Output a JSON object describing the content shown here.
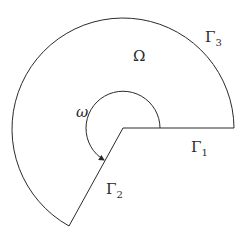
{
  "diagram": {
    "labels": {
      "domain": "Ω",
      "boundary_1": "Γ",
      "boundary_1_sub": "1",
      "boundary_2": "Γ",
      "boundary_2_sub": "2",
      "boundary_3": "Γ",
      "boundary_3_sub": "3",
      "angle": "ω"
    },
    "stroke_color": "#2a2a2a",
    "background": "#ffffff"
  }
}
